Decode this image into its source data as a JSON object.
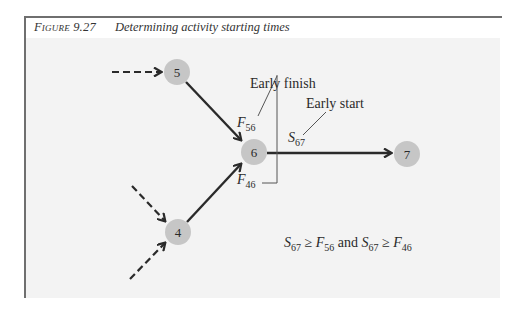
{
  "caption": {
    "figure_label": "Figure 9.27",
    "title": "Determining activity starting times"
  },
  "nodes": [
    {
      "id": "5",
      "label": "5",
      "cx": 177,
      "cy": 72
    },
    {
      "id": "6",
      "label": "6",
      "cx": 254,
      "cy": 152
    },
    {
      "id": "4",
      "label": "4",
      "cx": 178,
      "cy": 232
    },
    {
      "id": "7",
      "label": "7",
      "cx": 407,
      "cy": 154
    }
  ],
  "edges": [
    {
      "from": "5",
      "to": "6",
      "style": "solid"
    },
    {
      "from": "4",
      "to": "6",
      "style": "solid"
    },
    {
      "from": "6",
      "to": "7",
      "style": "solid"
    },
    {
      "from": "external",
      "to": "5",
      "style": "dashed"
    },
    {
      "from": "external",
      "to": "4",
      "style": "dashed"
    },
    {
      "from": "external",
      "to": "4",
      "style": "dashed"
    }
  ],
  "annotations": {
    "early_finish": "Early finish",
    "early_start": "Early start"
  },
  "variables": {
    "f56": {
      "main": "F",
      "sub": "56"
    },
    "f46": {
      "main": "F",
      "sub": "46"
    },
    "s67": {
      "main": "S",
      "sub": "67"
    }
  },
  "formula": {
    "part1_main": "S",
    "part1_sub": "67",
    "rel1": " ≥ ",
    "part2_main": "F",
    "part2_sub": "56",
    "conj": " and ",
    "part3_main": "S",
    "part3_sub": "67",
    "rel2": " ≥ ",
    "part4_main": "F",
    "part4_sub": "46"
  },
  "colors": {
    "node_fill": "#c6c6c6",
    "line": "#2a2a2a",
    "panel_bg": "#f3f3f3",
    "frame": "#6f6f6f"
  }
}
